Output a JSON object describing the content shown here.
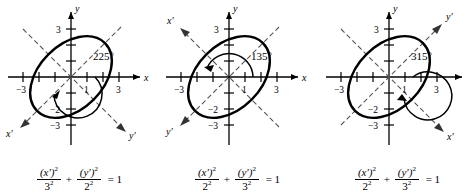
{
  "figure": {
    "panel_count": 3,
    "stroke_color": "#000000",
    "dash_color": "#555555",
    "background": "#ffffff"
  },
  "panels": [
    {
      "id": "panel-1",
      "angle_label": "225°",
      "angle_degrees": 225,
      "arc_direction": "counterclockwise",
      "axis_labels": {
        "x": "x",
        "y": "y",
        "x_prime": "x′",
        "y_prime": "y′"
      },
      "x_prime_direction": "down-left",
      "y_prime_direction": "down-right",
      "ticks": {
        "x": [
          "−3",
          "1",
          "3"
        ],
        "y": [
          "3",
          "−2",
          "−3"
        ]
      },
      "formula": {
        "num1": "(x′)",
        "num1_exp": "2",
        "den1": "3",
        "den1_exp": "2",
        "operator": "+",
        "num2": "(y′)",
        "num2_exp": "2",
        "den2": "2",
        "den2_exp": "2",
        "equals": "= 1",
        "plain": "(x')^2/3^2 + (y')^2/2^2 = 1"
      },
      "ellipse": {
        "semi_major": 3,
        "semi_minor": 2,
        "rotation_deg": 45
      }
    },
    {
      "id": "panel-2",
      "angle_label": "135°",
      "angle_degrees": 135,
      "arc_direction": "counterclockwise",
      "axis_labels": {
        "x": "x",
        "y": "y",
        "x_prime": "x′",
        "y_prime": "y′"
      },
      "x_prime_direction": "up-left",
      "y_prime_direction": "down-left",
      "ticks": {
        "x": [
          "−3",
          "1",
          "3"
        ],
        "y": [
          "3",
          "−2",
          "−3"
        ]
      },
      "formula": {
        "num1": "(x′)",
        "num1_exp": "2",
        "den1": "2",
        "den1_exp": "2",
        "operator": "+",
        "num2": "(y′)",
        "num2_exp": "2",
        "den2": "3",
        "den2_exp": "2",
        "equals": "= 1",
        "plain": "(x')^2/2^2 + (y')^2/3^2 = 1"
      },
      "ellipse": {
        "semi_major": 3,
        "semi_minor": 2,
        "rotation_deg": 45
      }
    },
    {
      "id": "panel-3",
      "angle_label": "315°",
      "angle_degrees": 315,
      "arc_direction": "counterclockwise",
      "axis_labels": {
        "x": "x",
        "y": "y",
        "x_prime": "x′",
        "y_prime": "y′"
      },
      "x_prime_direction": "down-right",
      "y_prime_direction": "up-right",
      "ticks": {
        "x": [
          "−3",
          "1",
          "3"
        ],
        "y": [
          "3",
          "−2",
          "−3"
        ]
      },
      "formula": {
        "num1": "(x′)",
        "num1_exp": "2",
        "den1": "2",
        "den1_exp": "2",
        "operator": "+",
        "num2": "(y′)",
        "num2_exp": "2",
        "den2": "3",
        "den2_exp": "2",
        "equals": "= 1",
        "plain": "(x')^2/2^2 + (y')^2/3^2 = 1"
      },
      "ellipse": {
        "semi_major": 3,
        "semi_minor": 2,
        "rotation_deg": 45
      }
    }
  ]
}
